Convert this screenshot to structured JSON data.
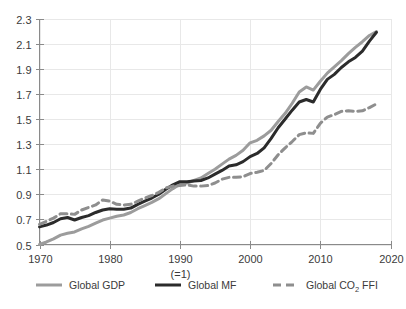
{
  "chart_data": {
    "type": "line",
    "title": "",
    "subtitle": "",
    "xlabel": "",
    "ylabel": "",
    "baseline_note": "(=1)",
    "baseline_year": 1990,
    "xlim": [
      1970,
      2020
    ],
    "ylim": [
      0.5,
      2.3
    ],
    "grid": true,
    "legend_position": "bottom",
    "xticks": [
      1970,
      1980,
      1990,
      2000,
      2010,
      2020
    ],
    "xtick_labels": [
      "1970",
      "1980",
      "1990",
      "2000",
      "2010",
      "2020"
    ],
    "yticks": [
      0.5,
      0.7,
      0.9,
      1.1,
      1.3,
      1.5,
      1.7,
      1.9,
      2.1,
      2.3
    ],
    "ytick_labels": [
      "0.5",
      "0.7",
      "0.9",
      "1.1",
      "1.3",
      "1.5",
      "1.7",
      "1.9",
      "2.1",
      "2.3"
    ],
    "x": [
      1970,
      1971,
      1972,
      1973,
      1974,
      1975,
      1976,
      1977,
      1978,
      1979,
      1980,
      1981,
      1982,
      1983,
      1984,
      1985,
      1986,
      1987,
      1988,
      1989,
      1990,
      1991,
      1992,
      1993,
      1994,
      1995,
      1996,
      1997,
      1998,
      1999,
      2000,
      2001,
      2002,
      2003,
      2004,
      2005,
      2006,
      2007,
      2008,
      2009,
      2010,
      2011,
      2012,
      2013,
      2014,
      2015,
      2016,
      2017,
      2018
    ],
    "series": [
      {
        "name": "Global GDP",
        "color": "#9c9c9c",
        "style": "solid",
        "width": 3,
        "values": [
          0.5,
          0.52,
          0.545,
          0.575,
          0.59,
          0.6,
          0.625,
          0.645,
          0.67,
          0.695,
          0.71,
          0.725,
          0.735,
          0.755,
          0.785,
          0.81,
          0.835,
          0.865,
          0.905,
          0.945,
          0.98,
          0.99,
          1.01,
          1.03,
          1.065,
          1.1,
          1.14,
          1.18,
          1.21,
          1.25,
          1.31,
          1.33,
          1.365,
          1.41,
          1.48,
          1.545,
          1.625,
          1.715,
          1.755,
          1.73,
          1.8,
          1.865,
          1.915,
          1.965,
          2.02,
          2.07,
          2.115,
          2.165,
          2.195
        ]
      },
      {
        "name": "Global MF",
        "color": "#2b2b2b",
        "style": "solid",
        "width": 3,
        "values": [
          0.64,
          0.655,
          0.675,
          0.705,
          0.715,
          0.695,
          0.715,
          0.73,
          0.755,
          0.775,
          0.785,
          0.78,
          0.78,
          0.79,
          0.82,
          0.845,
          0.87,
          0.9,
          0.94,
          0.975,
          1.0,
          1.0,
          1.005,
          1.01,
          1.03,
          1.06,
          1.09,
          1.125,
          1.135,
          1.16,
          1.2,
          1.225,
          1.27,
          1.345,
          1.43,
          1.5,
          1.57,
          1.635,
          1.655,
          1.635,
          1.735,
          1.815,
          1.855,
          1.91,
          1.955,
          1.99,
          2.04,
          2.12,
          2.19
        ]
      },
      {
        "name": "Global CO₂ FFI",
        "color": "#8e8e8e",
        "style": "dashed",
        "width": 3,
        "values": [
          0.66,
          0.685,
          0.71,
          0.745,
          0.745,
          0.74,
          0.775,
          0.795,
          0.815,
          0.855,
          0.845,
          0.82,
          0.815,
          0.82,
          0.845,
          0.87,
          0.89,
          0.915,
          0.95,
          0.965,
          0.97,
          0.975,
          0.965,
          0.965,
          0.97,
          0.99,
          1.02,
          1.035,
          1.035,
          1.04,
          1.065,
          1.075,
          1.09,
          1.145,
          1.215,
          1.27,
          1.32,
          1.375,
          1.39,
          1.385,
          1.465,
          1.515,
          1.535,
          1.56,
          1.565,
          1.56,
          1.565,
          1.59,
          1.62
        ]
      }
    ],
    "legend": [
      {
        "label": "Global GDP",
        "color": "#9c9c9c",
        "style": "solid"
      },
      {
        "label": "Global MF",
        "color": "#2b2b2b",
        "style": "solid"
      },
      {
        "label": "Global CO",
        "sub": "2",
        "label_tail": " FFI",
        "color": "#8e8e8e",
        "style": "dashed"
      }
    ]
  }
}
